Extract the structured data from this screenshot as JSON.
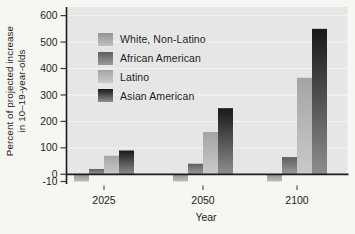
{
  "figure": {
    "ylabel_line1": "Percent of projected increase",
    "ylabel_line2": "in 10–19-year-olds",
    "xlabel": "Year"
  },
  "chart_data": {
    "type": "bar",
    "title": "",
    "xlabel": "Year",
    "ylabel": "Percent of projected increase in 10–19-year-olds",
    "categories": [
      "2025",
      "2050",
      "2100"
    ],
    "series": [
      {
        "name": "White, Non-Latino",
        "values": [
          -10,
          -10,
          -10
        ],
        "color_top": "#949494",
        "color_bottom": "#bfbfbf"
      },
      {
        "name": "African American",
        "values": [
          20,
          40,
          65
        ],
        "color_top": "#5e5e5e",
        "color_bottom": "#9c9c9c"
      },
      {
        "name": "Latino",
        "values": [
          70,
          160,
          365
        ],
        "color_top": "#a4a4a4",
        "color_bottom": "#cacaca"
      },
      {
        "name": "Asian American",
        "values": [
          90,
          250,
          550
        ],
        "color_top": "#191919",
        "color_bottom": "#8e8e8e"
      }
    ],
    "yticks": [
      -10,
      0,
      100,
      200,
      300,
      400,
      500,
      600
    ],
    "ylim": [
      -10,
      600
    ],
    "grid": false,
    "legend_position": "upper-left",
    "plot_bg_color": "#e6e6e6",
    "axis_color": "#1c1c1c"
  }
}
